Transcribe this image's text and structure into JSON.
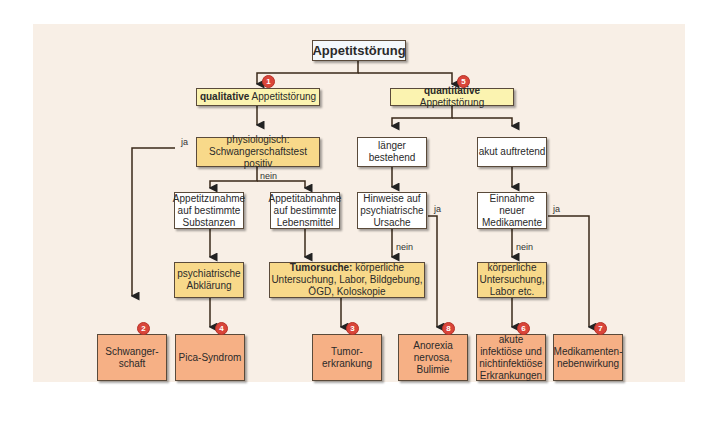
{
  "title": "Appetitstörung",
  "branches": {
    "qualitative": {
      "bold": "qualitative",
      "rest": " Appetitstörung",
      "marker": "1"
    },
    "quantitative": {
      "bold": "quantitative",
      "rest": " Appetitstörung",
      "marker": "5"
    }
  },
  "nodes": {
    "physiologisch": "physiologisch: Schwangerschaftstest positiv",
    "appetitzunahme": "Appetitzunahme auf bestimmte Substanzen",
    "appetitabnahme": "Appetitabnahme auf bestimmte Lebensmittel",
    "psych_abklaerung": "psychiatrische Abklärung",
    "tumorsuche_bold": "Tumorsuche:",
    "tumorsuche_rest": " körperliche Untersuchung, Labor, Bildgebung, ÖGD, Koloskopie",
    "laenger": "länger bestehend",
    "akut": "akut auftretend",
    "hinweise": "Hinweise auf psychiatrische Ursache",
    "einnahme": "Einnahme neuer Medikamente",
    "koerperlich": "körperliche Untersuchung, Labor etc."
  },
  "outcomes": [
    {
      "label": "Schwanger-schaft",
      "marker": "2"
    },
    {
      "label": "Pica-Syndrom",
      "marker": "4"
    },
    {
      "label": "Tumor-erkrankung",
      "marker": "3"
    },
    {
      "label": "Anorexia nervosa, Bulimie",
      "marker": "8"
    },
    {
      "label": "akute infektiöse und nichtinfektiöse Erkrankungen",
      "marker": "6"
    },
    {
      "label": "Medikamenten-nebenwirkung",
      "marker": "7"
    }
  ],
  "edge_labels": {
    "ja": "ja",
    "nein": "nein"
  },
  "colors": {
    "background": "#f8efe6",
    "white_box": "#ffffff",
    "yellow_box": "#fbf3b0",
    "gold_box": "#f8d98a",
    "outcome_box": "#f6b085",
    "marker": "#d9453a",
    "line": "#3a2a1a"
  }
}
